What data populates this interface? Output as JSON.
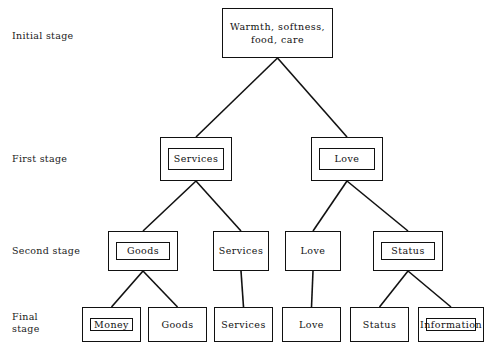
{
  "diagram": {
    "stroke_color": "#111111",
    "background_color": "#ffffff",
    "stage_labels": [
      {
        "name": "initial",
        "text": "Initial stage",
        "x": 12,
        "y": 30
      },
      {
        "name": "first",
        "text": "First stage",
        "x": 12,
        "y": 153
      },
      {
        "name": "second",
        "text": "Second stage",
        "x": 12,
        "y": 245
      },
      {
        "name": "final",
        "text": "Final\nstage",
        "x": 12,
        "y": 311
      }
    ],
    "nodes": [
      {
        "id": "root",
        "label": "Warmth, softness,\nfood, care",
        "stage": "initial",
        "x": 222,
        "y": 8,
        "w": 111,
        "h": 50,
        "double": false
      },
      {
        "id": "s1-services",
        "label": "Services",
        "stage": "first",
        "x": 160,
        "y": 137,
        "w": 72,
        "h": 44,
        "double": true
      },
      {
        "id": "s1-love",
        "label": "Love",
        "stage": "first",
        "x": 311,
        "y": 137,
        "w": 72,
        "h": 44,
        "double": true
      },
      {
        "id": "s2-goods",
        "label": "Goods",
        "stage": "second",
        "x": 108,
        "y": 231,
        "w": 70,
        "h": 40,
        "double": true
      },
      {
        "id": "s2-services",
        "label": "Services",
        "stage": "second",
        "x": 213,
        "y": 231,
        "w": 56,
        "h": 40,
        "double": false
      },
      {
        "id": "s2-love",
        "label": "Love",
        "stage": "second",
        "x": 285,
        "y": 231,
        "w": 56,
        "h": 40,
        "double": false
      },
      {
        "id": "s2-status",
        "label": "Status",
        "stage": "second",
        "x": 373,
        "y": 231,
        "w": 70,
        "h": 40,
        "double": true
      },
      {
        "id": "f-money",
        "label": "Money",
        "stage": "final",
        "x": 82,
        "y": 307,
        "w": 59,
        "h": 35,
        "double": true
      },
      {
        "id": "f-goods",
        "label": "Goods",
        "stage": "final",
        "x": 148,
        "y": 307,
        "w": 59,
        "h": 35,
        "double": false
      },
      {
        "id": "f-services",
        "label": "Services",
        "stage": "final",
        "x": 214,
        "y": 307,
        "w": 59,
        "h": 35,
        "double": false
      },
      {
        "id": "f-love",
        "label": "Love",
        "stage": "final",
        "x": 282,
        "y": 307,
        "w": 59,
        "h": 35,
        "double": false
      },
      {
        "id": "f-status",
        "label": "Status",
        "stage": "final",
        "x": 350,
        "y": 307,
        "w": 59,
        "h": 35,
        "double": false
      },
      {
        "id": "f-information",
        "label": "Information",
        "stage": "final",
        "x": 418,
        "y": 307,
        "w": 66,
        "h": 35,
        "double": true
      }
    ],
    "edges": [
      {
        "from": "root",
        "to": "s1-services",
        "x1": 277.5,
        "y1": 58,
        "x2": 196,
        "y2": 137
      },
      {
        "from": "root",
        "to": "s1-love",
        "x1": 277.5,
        "y1": 58,
        "x2": 347,
        "y2": 137
      },
      {
        "from": "s1-services",
        "to": "s2-goods",
        "x1": 196,
        "y1": 181,
        "x2": 143,
        "y2": 231
      },
      {
        "from": "s1-services",
        "to": "s2-services",
        "x1": 196,
        "y1": 181,
        "x2": 241,
        "y2": 231
      },
      {
        "from": "s1-love",
        "to": "s2-love",
        "x1": 347,
        "y1": 181,
        "x2": 313,
        "y2": 231
      },
      {
        "from": "s1-love",
        "to": "s2-status",
        "x1": 347,
        "y1": 181,
        "x2": 408,
        "y2": 231
      },
      {
        "from": "s2-goods",
        "to": "f-money",
        "x1": 143,
        "y1": 271,
        "x2": 111.5,
        "y2": 307
      },
      {
        "from": "s2-goods",
        "to": "f-goods",
        "x1": 143,
        "y1": 271,
        "x2": 177.5,
        "y2": 307
      },
      {
        "from": "s2-services",
        "to": "f-services",
        "x1": 241,
        "y1": 271,
        "x2": 243.5,
        "y2": 307
      },
      {
        "from": "s2-love",
        "to": "f-love",
        "x1": 313,
        "y1": 271,
        "x2": 311.5,
        "y2": 307
      },
      {
        "from": "s2-status",
        "to": "f-status",
        "x1": 408,
        "y1": 271,
        "x2": 379.5,
        "y2": 307
      },
      {
        "from": "s2-status",
        "to": "f-information",
        "x1": 408,
        "y1": 271,
        "x2": 451,
        "y2": 307
      }
    ]
  }
}
